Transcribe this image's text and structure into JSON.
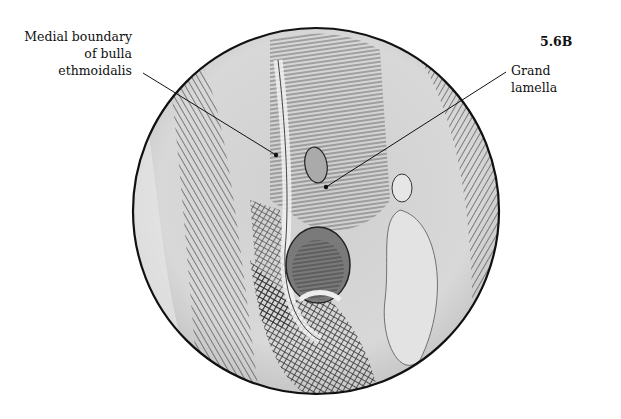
{
  "figure": {
    "number": "5.6B",
    "labels": [
      {
        "id": "medial-boundary",
        "lines": [
          "Medial boundary",
          "of bulla",
          "ethmoidalis"
        ]
      },
      {
        "id": "grand-lamella",
        "lines": [
          "Grand",
          "lamella"
        ]
      }
    ],
    "colors": {
      "background": "#ffffff",
      "outline": "#111111",
      "tissue": "#d9d9d9",
      "shadow": "#555555"
    }
  }
}
